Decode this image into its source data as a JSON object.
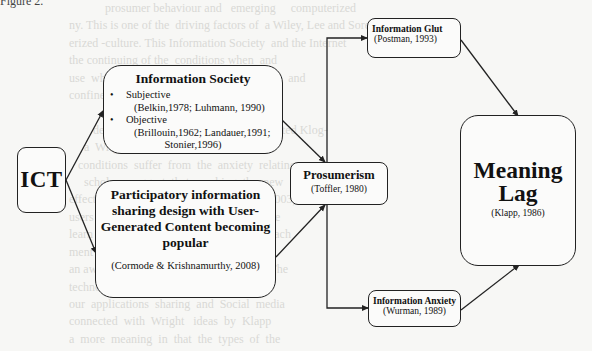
{
  "figure": {
    "label": "Figure 2."
  },
  "nodes": {
    "ict": {
      "title": "ICT"
    },
    "information_society": {
      "title": "Information Society",
      "items": [
        {
          "label": "Subjective",
          "cite": "(Belkin,1978; Luhmann, 1990)"
        },
        {
          "label": "Objective",
          "cite_line1": "(Brillouin,1962; Landauer,1991;",
          "cite_line2": "Stonier,1996)"
        }
      ]
    },
    "participatory": {
      "title": "Participatory information sharing design with User-Generated Content becoming popular",
      "cite": "(Cormode & Krishnamurthy, 2008)"
    },
    "prosumerism": {
      "title": "Prosumerism",
      "cite": "(Toffler, 1980)"
    },
    "information_glut": {
      "title": "Information Glut",
      "cite": "(Postman, 1993)"
    },
    "meaning_lag": {
      "title_line1": "Meaning",
      "title_line2": "Lag",
      "cite": "(Klapp, 1986)"
    },
    "information_anxiety": {
      "title": "Information Anxiety",
      "cite": "(Wurman, 1989)"
    }
  },
  "edges": [
    {
      "from": "ICT",
      "to": "Information Society"
    },
    {
      "from": "ICT",
      "to": "Participatory information sharing"
    },
    {
      "from": "Information Society",
      "to": "Prosumerism"
    },
    {
      "from": "Participatory information sharing",
      "to": "Prosumerism"
    },
    {
      "from": "Prosumerism",
      "to": "Information Glut"
    },
    {
      "from": "Prosumerism",
      "to": "Information Anxiety"
    },
    {
      "from": "Information Glut",
      "to": "Meaning Lag"
    },
    {
      "from": "Information Anxiety",
      "to": "Meaning Lag"
    }
  ],
  "colors": {
    "line": "#222222",
    "box_fill": "#fbfbfa",
    "page_bg": "#f7f7f5",
    "bleed_text": "#d9d9d6"
  },
  "background_bleed_text": "                                   prosumer behaviour and   emerging     computerized\n                       ny. This is one of the  driving factors of  a Wiley, Lee and Soren\n                       erized ‑culture. This Information Society  and the Internet\n                       the continuing of the  conditions when  and\n                       use  when  also  and       the  social   impulse  and\n                       confined  and  people   (Goh, 2005)\n                                  digital  a  so  early          a  e\n                               developments and  Parks (1998) prompted Klog-\n                            a  Wright and Sundar (2010)  the  not\n                          conditions  suffer  from  the  anxiety  relating\n                            scholars  suggest  that  reaching  the  new\n                       effect  brought  anxiety  and the  Weber  (2003)\n                       users  new  Facebook  etc  new  designs  we\n                       learn  that  the  number  of  information  reach\n                       ment  is  always  to  be  evaluated\n                       an awareness  of  Web 2.0  technologies.  The\n                       technological  tools  in  computing  have\n                       our  applications  sharing  and  Social  media\n                       connected  with  Wright   ideas  by  Klapp\n                       a  more  meaning  in  that  the  types  of  the"
}
